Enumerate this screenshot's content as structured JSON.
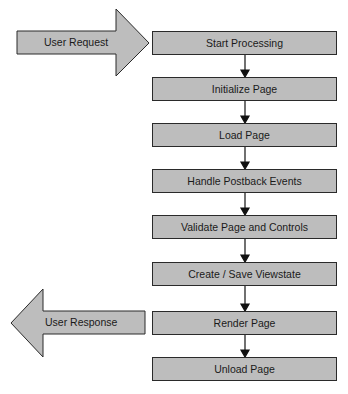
{
  "diagram": {
    "colors": {
      "box_fill": "#bdbdbd",
      "stroke": "#2a2a2a",
      "background": "#ffffff"
    },
    "input_arrow": {
      "label": "User Request",
      "direction": "right"
    },
    "output_arrow": {
      "label": "User Response",
      "direction": "left"
    },
    "steps": [
      {
        "label": "Start Processing"
      },
      {
        "label": "Initialize Page"
      },
      {
        "label": "Load Page"
      },
      {
        "label": "Handle Postback Events"
      },
      {
        "label": "Validate Page and Controls"
      },
      {
        "label": "Create / Save Viewstate"
      },
      {
        "label": "Render Page"
      },
      {
        "label": "Unload Page"
      }
    ]
  }
}
